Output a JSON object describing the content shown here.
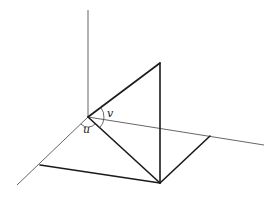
{
  "diagram": {
    "type": "3d-coordinate-sketch",
    "labels": {
      "angle_u": "u",
      "angle_v": "v"
    },
    "colors": {
      "background": "#ffffff",
      "axis": "#555555",
      "edge": "#1a1a1a"
    },
    "points": {
      "origin": [
        88,
        117
      ],
      "vertical_axis_top": [
        88,
        10
      ],
      "apex": [
        160,
        63
      ],
      "foot": [
        160,
        183
      ],
      "right_axis_end": [
        264,
        145
      ],
      "left_axis_end": [
        17,
        185
      ],
      "right_ground_corner": [
        210,
        136
      ],
      "left_ground_corner": [
        40,
        165
      ]
    }
  }
}
